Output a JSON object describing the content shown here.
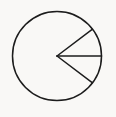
{
  "figure": {
    "canvas": {
      "width": 116,
      "height": 117
    },
    "background_color": "#f9f8f6",
    "stroke_color": "#1c1c1c",
    "stroke_width": 1.5,
    "circle": {
      "name": "main-circle",
      "center_x": 57,
      "center_y": 56,
      "radius": 44.5
    },
    "vertex": {
      "name": "angle-vertex",
      "x": 57,
      "y": 56
    },
    "rays": [
      {
        "name": "upper-chord",
        "from_x": 57,
        "from_y": 56,
        "to_x": 92.5,
        "to_y": 29.2,
        "angle_degrees": 37
      },
      {
        "name": "lower-chord",
        "from_x": 57,
        "from_y": 56,
        "to_x": 92.5,
        "to_y": 82.8,
        "angle_degrees": -37
      },
      {
        "name": "horizontal-radius",
        "from_x": 57,
        "from_y": 56,
        "to_x": 101.5,
        "to_y": 56,
        "angle_degrees": 0
      }
    ],
    "labels": []
  }
}
